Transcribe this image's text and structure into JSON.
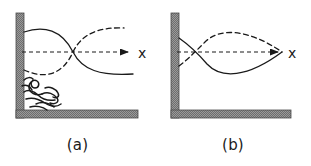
{
  "figure": {
    "background_color": "#ffffff",
    "ink_color": "#1a1a1a",
    "hatch_color": "#8c8c8c",
    "panels": [
      {
        "id": "a",
        "caption": "(a)",
        "axis_label": "x",
        "wall": {
          "name": "vertical-wall",
          "x": 16,
          "y": 13,
          "width": 8,
          "height": 105,
          "fill": "#8c8c8c"
        },
        "floor": {
          "name": "horizontal-floor",
          "x": 16,
          "y": 110,
          "width": 122,
          "height": 8,
          "fill": "#8c8c8c"
        },
        "axis": {
          "name": "x-axis",
          "y": 52,
          "x_start": 22,
          "x_end": 133,
          "arrow_tip_x": 133,
          "label_x": 142,
          "label_y": 57,
          "style": "dashed"
        },
        "solid_curve": {
          "name": "incident-wave-solid",
          "style": "solid",
          "description": "starts at wall top, arcs above axis then crosses below and flattens out"
        },
        "dashed_curve": {
          "name": "reflected-wave-dashed",
          "style": "dashed",
          "description": "mirror image, starts below axis at wall then arcs above to the right"
        },
        "crossing_point": {
          "x": 73,
          "y": 52
        },
        "scribble": {
          "name": "tangled-scribble",
          "x": 20,
          "y": 78,
          "width": 42,
          "height": 33,
          "description": "irregular tangled knot drawn at the base of the wall"
        }
      },
      {
        "id": "b",
        "caption": "(b)",
        "axis_label": "x",
        "wall": {
          "name": "vertical-wall",
          "x": 16,
          "y": 13,
          "width": 8,
          "height": 105,
          "fill": "#8c8c8c"
        },
        "floor": {
          "name": "horizontal-floor",
          "x": 16,
          "y": 110,
          "width": 120,
          "height": 8,
          "fill": "#8c8c8c"
        },
        "axis": {
          "name": "x-axis",
          "y": 52,
          "x_start": 22,
          "x_end": 128,
          "arrow_tip_x": 128,
          "label_x": 137,
          "label_y": 57,
          "style": "dashed"
        },
        "solid_curve": {
          "name": "incident-wave-solid",
          "style": "solid",
          "description": "starts high at wall, dips below axis forming a trough, rises to arrow tip"
        },
        "dashed_curve": {
          "name": "reflected-wave-dashed",
          "style": "dashed",
          "description": "starts low at wall, arcs above axis forming a crest, falls to arrow tip"
        },
        "crossing_point": {
          "x": 41,
          "y": 52
        },
        "scribble": null
      }
    ]
  }
}
